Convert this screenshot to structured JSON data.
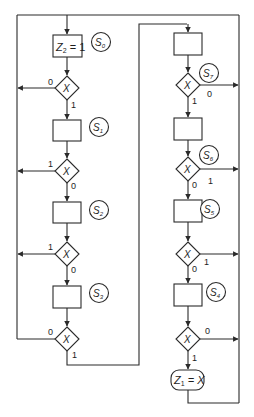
{
  "diagram": {
    "type": "ASM chart",
    "left_column": {
      "states": [
        {
          "id": "S0",
          "label_main": "S",
          "label_sub": "0",
          "output_main": "Z",
          "output_sub": "2",
          "output_rest": " = 1"
        },
        {
          "id": "S1",
          "label_main": "S",
          "label_sub": "1"
        },
        {
          "id": "S2",
          "label_main": "S",
          "label_sub": "2"
        },
        {
          "id": "S3",
          "label_main": "S",
          "label_sub": "3"
        }
      ],
      "decisions": [
        {
          "var": "X",
          "side_label": "0",
          "down_label": "1"
        },
        {
          "var": "X",
          "side_label": "1",
          "down_label": "0"
        },
        {
          "var": "X",
          "side_label": "1",
          "down_label": "0"
        },
        {
          "var": "X",
          "side_label": "0",
          "down_label": "1"
        }
      ]
    },
    "right_column": {
      "states": [
        {
          "id": "S7",
          "label_main": "S",
          "label_sub": "7"
        },
        {
          "id": "S6",
          "label_main": "S",
          "label_sub": "6"
        },
        {
          "id": "S5",
          "label_main": "S",
          "label_sub": "5"
        },
        {
          "id": "S4",
          "label_main": "S",
          "label_sub": "4"
        }
      ],
      "decisions": [
        {
          "var": "X",
          "side_label": "0",
          "down_label": "1"
        },
        {
          "var": "X",
          "side_label": "1",
          "down_label": "0"
        },
        {
          "var": "X",
          "side_label": "1",
          "down_label": "0"
        },
        {
          "var": "X",
          "side_label": "0",
          "down_label": "1"
        }
      ],
      "conditional_output": {
        "main": "Z",
        "sub": "1",
        "rest": " = X"
      }
    }
  }
}
